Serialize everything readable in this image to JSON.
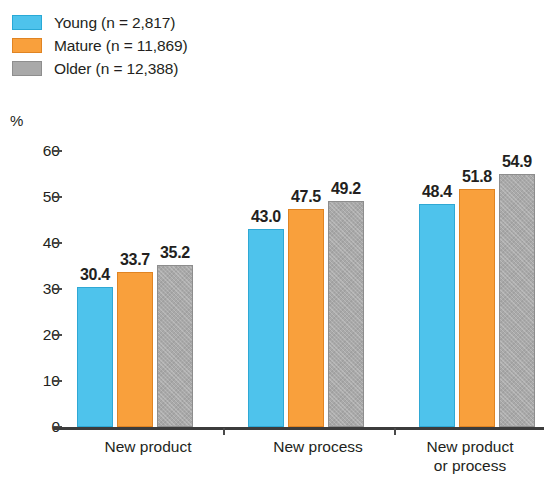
{
  "chart_data": {
    "type": "bar",
    "title": "",
    "subtitle": "",
    "xlabel": "",
    "ylabel": "%",
    "ylim": [
      0,
      60
    ],
    "yticks": [
      0,
      10,
      20,
      30,
      40,
      50,
      60
    ],
    "ytick_labels": [
      "0",
      "10",
      "20",
      "30",
      "40",
      "50",
      "60"
    ],
    "grid": false,
    "legend_position": "top-left",
    "categories": [
      "New product",
      "New process",
      "New product\nor process"
    ],
    "series": [
      {
        "name": "Young (n = 2,817)",
        "short_name": "Young",
        "n": "2,817",
        "color": "#4ec3ec",
        "values": [
          30.4,
          33.7,
          48.4
        ],
        "value_labels": [
          "30.4",
          "43.0",
          "48.4"
        ]
      },
      {
        "name": "Mature (n = 11,869)",
        "short_name": "Mature",
        "n": "11,869",
        "color": "#f9a03c",
        "values": [
          33.7,
          47.5,
          51.8
        ],
        "value_labels": [
          "33.7",
          "47.5",
          "51.8"
        ]
      },
      {
        "name": "Older (n = 12,388)",
        "short_name": "Older",
        "n": "12,388",
        "color": "#a9a9a9",
        "values": [
          35.2,
          49.2,
          54.9
        ],
        "value_labels": [
          "35.2",
          "49.2",
          "54.9"
        ]
      }
    ],
    "groups": [
      {
        "category": "New product",
        "bars": [
          {
            "series": "Young (n = 2,817)",
            "value": 30.4,
            "label": "30.4",
            "color": "#4ec3ec"
          },
          {
            "series": "Mature (n = 11,869)",
            "value": 33.7,
            "label": "33.7",
            "color": "#f9a03c"
          },
          {
            "series": "Older (n = 12,388)",
            "value": 35.2,
            "label": "35.2",
            "color": "#a9a9a9"
          }
        ]
      },
      {
        "category": "New process",
        "bars": [
          {
            "series": "Young (n = 2,817)",
            "value": 43.0,
            "label": "43.0",
            "color": "#4ec3ec"
          },
          {
            "series": "Mature (n = 11,869)",
            "value": 47.5,
            "label": "47.5",
            "color": "#f9a03c"
          },
          {
            "series": "Older (n = 12,388)",
            "value": 49.2,
            "label": "49.2",
            "color": "#a9a9a9"
          }
        ]
      },
      {
        "category": "New product or process",
        "bars": [
          {
            "series": "Young (n = 2,817)",
            "value": 48.4,
            "label": "48.4",
            "color": "#4ec3ec"
          },
          {
            "series": "Mature (n = 11,869)",
            "value": 51.8,
            "label": "51.8",
            "color": "#f9a03c"
          },
          {
            "series": "Older (n = 12,388)",
            "value": 54.9,
            "label": "54.9",
            "color": "#a9a9a9"
          }
        ]
      }
    ]
  },
  "legend": {
    "items": [
      {
        "label": "Young (n = 2,817)",
        "swatch": "blue"
      },
      {
        "label": "Mature (n = 11,869)",
        "swatch": "orange"
      },
      {
        "label": "Older (n = 12,388)",
        "swatch": "grey"
      }
    ]
  },
  "axis": {
    "y_unit_label": "%",
    "y_tick_labels": [
      "60",
      "50",
      "40",
      "30",
      "20",
      "10",
      "0"
    ],
    "x_category_labels": [
      "New product",
      "New process",
      "New product\nor process"
    ]
  }
}
